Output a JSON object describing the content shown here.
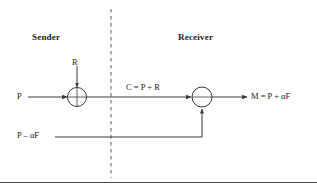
{
  "figure": {
    "width": 317,
    "height": 188,
    "background": "#ffffff",
    "line_color": "#3a3a3a",
    "text_color": "#1a1a1a",
    "divider_color": "#9a9a9a",
    "baseline_color": "#4a4a4a"
  },
  "labels": {
    "sender": "Sender",
    "receiver": "Receiver",
    "noise": "R",
    "plaintext": "P",
    "ciphertext": "C = P + R",
    "output": "M = P + αF",
    "feedback": "P – αF"
  },
  "nodes": {
    "adder_sender": {
      "cx": 77,
      "cy": 97,
      "r": 9.5,
      "symbol": "cross"
    },
    "adder_receiver": {
      "cx": 202,
      "cy": 97,
      "r": 10,
      "symbol": "line"
    }
  },
  "divider": {
    "x": 111,
    "y1": 9,
    "y2": 178,
    "style": "dashed"
  },
  "signals": [
    {
      "name": "plaintext-in",
      "from": [
        28,
        97
      ],
      "to": [
        68,
        97
      ],
      "direction": "right"
    },
    {
      "name": "noise-in",
      "from": [
        77,
        65
      ],
      "to": [
        77,
        88
      ],
      "direction": "down"
    },
    {
      "name": "ciphertext-channel",
      "from": [
        86,
        97
      ],
      "to": [
        192,
        97
      ],
      "direction": "right"
    },
    {
      "name": "output-out",
      "from": [
        212,
        97
      ],
      "to": [
        248,
        97
      ],
      "direction": "right"
    },
    {
      "name": "feedback-path",
      "from": [
        55,
        137
      ],
      "to": [
        202,
        137
      ],
      "direction": "up"
    }
  ],
  "baseline": {
    "y": 182,
    "x1": 0,
    "x2": 317
  }
}
